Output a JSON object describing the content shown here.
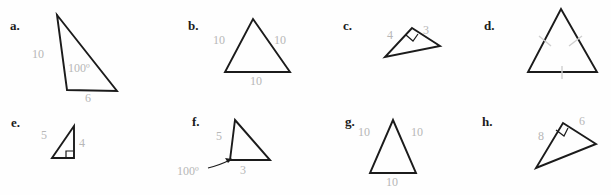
{
  "page": {
    "background_color": "#ffffff",
    "stroke_color": "#1b1b1b",
    "label_color": "#b7b7b7",
    "letter_color": "#1b1b1b"
  },
  "problems": [
    {
      "key": "a",
      "letter": "a.",
      "description": "obtuse scalene triangle",
      "labels": [
        {
          "name": "side-10",
          "text": "10"
        },
        {
          "name": "angle-100",
          "text": "100º"
        },
        {
          "name": "side-6",
          "text": "6"
        }
      ],
      "marks": []
    },
    {
      "key": "b",
      "letter": "b.",
      "description": "equilateral triangle with all sides 10",
      "labels": [
        {
          "name": "side-left-10",
          "text": "10"
        },
        {
          "name": "side-right-10",
          "text": "10"
        },
        {
          "name": "side-base-10",
          "text": "10"
        }
      ],
      "marks": []
    },
    {
      "key": "c",
      "letter": "c.",
      "description": "right triangle with legs 4 and 3",
      "labels": [
        {
          "name": "side-4",
          "text": "4"
        },
        {
          "name": "side-3",
          "text": "3"
        }
      ],
      "marks": [
        "right-angle-square"
      ]
    },
    {
      "key": "d",
      "letter": "d.",
      "description": "triangle with congruence tick marks on all three sides",
      "labels": [],
      "marks": [
        "tick-left",
        "tick-right",
        "tick-base"
      ]
    },
    {
      "key": "e",
      "letter": "e.",
      "description": "right triangle with sides 5 and 4",
      "labels": [
        {
          "name": "side-5",
          "text": "5"
        },
        {
          "name": "side-4",
          "text": "4"
        }
      ],
      "marks": [
        "right-angle-square"
      ]
    },
    {
      "key": "f",
      "letter": "f.",
      "description": "obtuse triangle with side 5, angle 100 degrees, side 3",
      "labels": [
        {
          "name": "side-5",
          "text": "5"
        },
        {
          "name": "angle-100",
          "text": "100º"
        },
        {
          "name": "side-3",
          "text": "3"
        }
      ],
      "marks": [
        "angle-leader-arrow"
      ]
    },
    {
      "key": "g",
      "letter": "g.",
      "description": "equilateral triangle with all sides 10",
      "labels": [
        {
          "name": "side-left-10",
          "text": "10"
        },
        {
          "name": "side-right-10",
          "text": "10"
        },
        {
          "name": "side-base-10",
          "text": "10"
        }
      ],
      "marks": []
    },
    {
      "key": "h",
      "letter": "h.",
      "description": "rotated right triangle with legs 8 and 6",
      "labels": [
        {
          "name": "side-8",
          "text": "8"
        },
        {
          "name": "side-6",
          "text": "6"
        }
      ],
      "marks": [
        "right-angle-square"
      ]
    }
  ]
}
